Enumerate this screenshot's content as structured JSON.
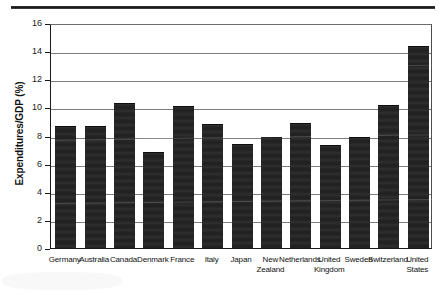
{
  "chart_data": {
    "type": "bar",
    "title": "",
    "subtitle": "",
    "xlabel": "",
    "ylabel": "Expenditures/GDP (%)",
    "ylim": [
      0,
      16
    ],
    "ytick_values": [
      0,
      2,
      4,
      6,
      8,
      10,
      12,
      14,
      16
    ],
    "ytick_labels": [
      "0",
      "2",
      "4",
      "6",
      "8",
      "10",
      "12",
      "14",
      "16"
    ],
    "grid": "horizontal",
    "legend": "none",
    "bar_color": "#242424",
    "categories": [
      "Germany",
      "Australia",
      "Canada",
      "Denmark",
      "France",
      "Italy",
      "Japan",
      "New\nZealand",
      "Netherlands",
      "United\nKingdom",
      "Sweden",
      "Switzerland",
      "United\nStates"
    ],
    "categories_flat": [
      "Germany",
      "Australia",
      "Canada",
      "Denmark",
      "France",
      "Italy",
      "Japan",
      "New Zealand",
      "Netherlands",
      "United Kingdom",
      "Sweden",
      "Switzerland",
      "United States"
    ],
    "values": [
      8.7,
      8.7,
      10.3,
      6.8,
      10.1,
      8.8,
      7.4,
      7.9,
      8.9,
      7.3,
      7.9,
      10.2,
      14.4
    ],
    "series": [
      {
        "name": "Expenditures/GDP (%)",
        "values": [
          8.7,
          8.7,
          10.3,
          6.8,
          10.1,
          8.8,
          7.4,
          7.9,
          8.9,
          7.3,
          7.9,
          10.2,
          14.4
        ]
      }
    ]
  },
  "decor": {
    "top_rule_color": "#1a1a1a"
  }
}
